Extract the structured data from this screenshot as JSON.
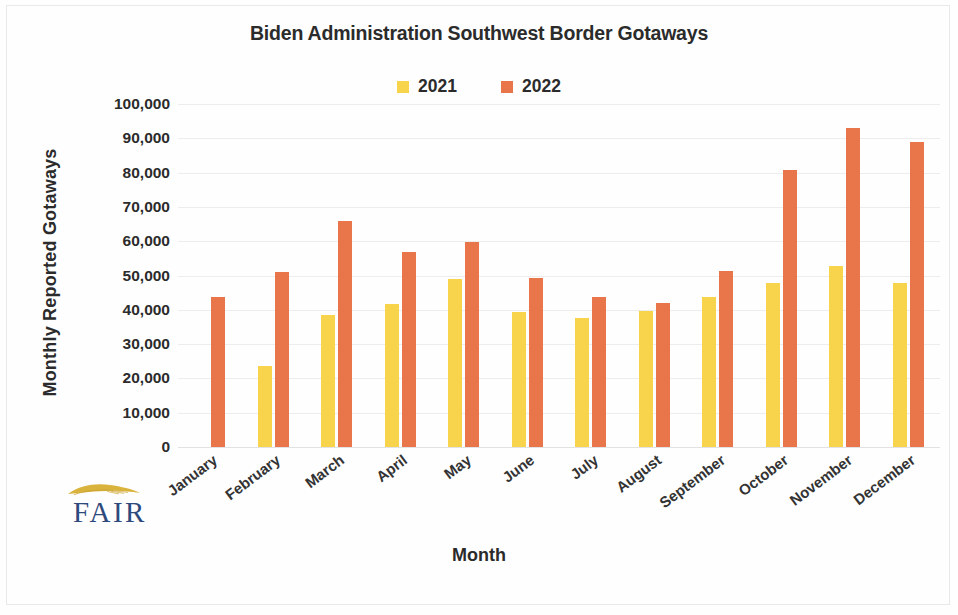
{
  "chart_data": {
    "type": "bar",
    "title": "Biden Administration Southwest Border Gotaways",
    "xlabel": "Month",
    "ylabel": "Monthly Reported Gotaways",
    "ylim": [
      0,
      100000
    ],
    "ytick_step": 10000,
    "grid": true,
    "legend_position": "top-center",
    "categories": [
      "January",
      "February",
      "March",
      "April",
      "May",
      "June",
      "July",
      "August",
      "September",
      "October",
      "November",
      "December"
    ],
    "ytick_labels": [
      "100,000",
      "90,000",
      "80,000",
      "70,000",
      "60,000",
      "50,000",
      "40,000",
      "30,000",
      "20,000",
      "10,000",
      "0"
    ],
    "ytick_values": [
      100000,
      90000,
      80000,
      70000,
      60000,
      50000,
      40000,
      30000,
      20000,
      10000,
      0
    ],
    "series": [
      {
        "name": "2021",
        "color": "#f7d44c",
        "values": [
          null,
          23700,
          38400,
          41700,
          48900,
          39300,
          37600,
          39800,
          43700,
          47900,
          52900,
          47900
        ]
      },
      {
        "name": "2022",
        "color": "#e8764a",
        "values": [
          43700,
          51000,
          65900,
          56800,
          59700,
          49400,
          43600,
          42000,
          51400,
          80700,
          93000,
          88900
        ]
      }
    ]
  },
  "logo": {
    "wordmark": "FAIR",
    "wing_color": "#d9b33c",
    "word_color": "#2e4a7d"
  }
}
